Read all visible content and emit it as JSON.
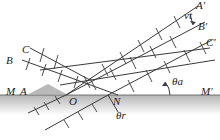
{
  "diagram": {
    "colors": {
      "line": "#3a3a3a",
      "surface_top": "#b9b9b9",
      "surface_bottom": "#ffffff",
      "wedge": "#a8a8a8"
    },
    "labels": {
      "A_prime": "A′",
      "vt": "vt",
      "B_prime": "B′",
      "C_prime": "C′",
      "C": "C",
      "B": "B",
      "M": "M",
      "A": "A",
      "O": "O",
      "N": "N",
      "M_prime": "M′",
      "theta_a": "θa",
      "theta_r": "θr"
    }
  }
}
